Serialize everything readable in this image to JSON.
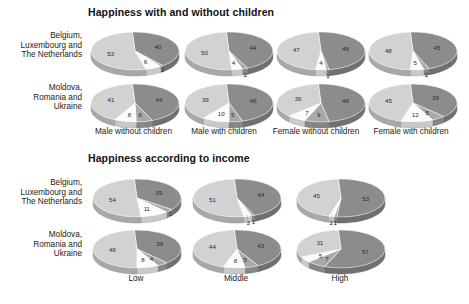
{
  "chart_data": [
    {
      "type": "pie",
      "title": "Happiness with and without children",
      "row_labels": [
        "Belgium, Luxembourg and The Netherlands",
        "Moldova, Romania and Ukraine"
      ],
      "categories": [
        "Male without children",
        "Male with children",
        "Female without children",
        "Female with children"
      ],
      "slice_names": [
        "dark",
        "mid-dark",
        "white",
        "light"
      ],
      "slice_colors": [
        "#8c8c8c",
        "#a8a8a8",
        "#fbfbfb",
        "#d2d2d2"
      ],
      "grid": false,
      "legend": "none",
      "pies": [
        {
          "row": 0,
          "col": 0,
          "values": [
            40,
            1,
            6,
            53
          ]
        },
        {
          "row": 0,
          "col": 1,
          "values": [
            44,
            2,
            4,
            50
          ]
        },
        {
          "row": 0,
          "col": 2,
          "values": [
            48,
            1,
            4,
            47
          ]
        },
        {
          "row": 0,
          "col": 3,
          "values": [
            45,
            2,
            5,
            48
          ]
        },
        {
          "row": 1,
          "col": 0,
          "values": [
            44,
            6,
            8,
            41
          ]
        },
        {
          "row": 1,
          "col": 1,
          "values": [
            46,
            5,
            10,
            39
          ]
        },
        {
          "row": 1,
          "col": 2,
          "values": [
            48,
            9,
            7,
            36
          ]
        },
        {
          "row": 1,
          "col": 3,
          "values": [
            39,
            5,
            12,
            45
          ]
        }
      ]
    },
    {
      "type": "pie",
      "title": "Happiness according to income",
      "row_labels": [
        "Belgium, Luxembourg and The Netherlands",
        "Moldova, Romania and Ukraine"
      ],
      "categories": [
        "Low",
        "Middle",
        "High"
      ],
      "slice_names": [
        "dark",
        "mid-dark",
        "white",
        "light"
      ],
      "slice_colors": [
        "#8c8c8c",
        "#a8a8a8",
        "#fbfbfb",
        "#d2d2d2"
      ],
      "grid": false,
      "legend": "none",
      "pies": [
        {
          "row": 0,
          "col": 0,
          "values": [
            39,
            3,
            11,
            54
          ]
        },
        {
          "row": 0,
          "col": 1,
          "values": [
            44,
            1,
            3,
            51
          ]
        },
        {
          "row": 0,
          "col": 2,
          "values": [
            53,
            1,
            2,
            45
          ]
        },
        {
          "row": 1,
          "col": 0,
          "values": [
            39,
            4,
            8,
            49
          ]
        },
        {
          "row": 1,
          "col": 1,
          "values": [
            43,
            5,
            8,
            44
          ]
        },
        {
          "row": 1,
          "col": 2,
          "values": [
            57,
            7,
            5,
            31
          ]
        }
      ]
    }
  ],
  "panels": {
    "top": {
      "title": "Happiness with and without children",
      "row_labels": [
        "Belgium,\nLuxembourg and\nThe Netherlands",
        "Moldova,\nRomania and\nUkraine"
      ],
      "col_labels": [
        "Male without children",
        "Male with children",
        "Female without children",
        "Female with children"
      ]
    },
    "bottom": {
      "title": "Happiness according to income",
      "row_labels": [
        "Belgium,\nLuxembourg and\nThe Netherlands",
        "Moldova,\nRomania and\nUkraine"
      ],
      "col_labels": [
        "Low",
        "Middle",
        "High"
      ]
    }
  }
}
